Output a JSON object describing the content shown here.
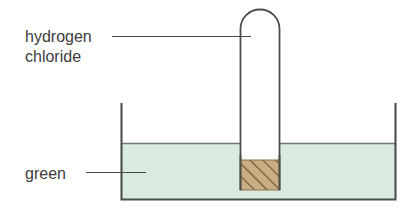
{
  "figure": {
    "type": "science-diagram",
    "background_color": "#ffffff"
  },
  "labels": {
    "gas": {
      "line1": "hydrogen",
      "line2": "chloride",
      "points_to": "inside-test-tube",
      "text_color": "#3c3c3c"
    },
    "liquid": {
      "text": "green",
      "points_to": "liquid-in-beaker",
      "text_color": "#3c3c3c"
    }
  },
  "apparatus": {
    "beaker": {
      "name": "beaker",
      "wall_color": "#4b4f4b",
      "interior_label": "green"
    },
    "liquid": {
      "name": "indicator-solution",
      "color": "#d9ebdf",
      "surface_label": "liquid-surface"
    },
    "test_tube": {
      "name": "inverted-test-tube",
      "contents": "hydrogen chloride",
      "wall_color": "#4b4f4b",
      "fill_color": "#ffffff"
    },
    "plug": {
      "name": "porous-plug",
      "fill_color": "#c9ad83",
      "hatch_color": "#6e5a38",
      "edge_color": "#8a7550"
    }
  }
}
